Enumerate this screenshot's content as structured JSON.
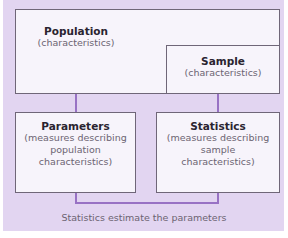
{
  "diagram": {
    "population": {
      "title": "Population",
      "subtitle": "(characteristics)"
    },
    "sample": {
      "title": "Sample",
      "subtitle": "(characteristics)"
    },
    "parameters": {
      "title": "Parameters",
      "line1": "(measures describing",
      "line2": "population",
      "line3": "characteristics)"
    },
    "statistics": {
      "title": "Statistics",
      "line1": "(measures describing",
      "line2": "sample",
      "line3": "characteristics)"
    },
    "caption": "Statistics estimate the parameters"
  },
  "colors": {
    "background": "#e2d5f1",
    "box_fill": "#f7f4fb",
    "connector": "#9872c4",
    "border": "#6f6678"
  }
}
